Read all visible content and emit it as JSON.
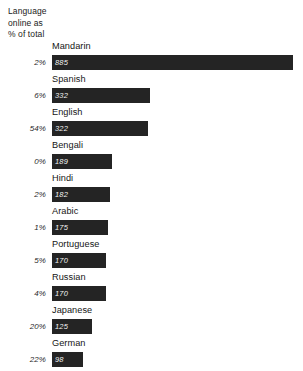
{
  "axis_caption": {
    "line1": "Language",
    "line2": "online as",
    "line3": "% of total"
  },
  "chart_data": {
    "type": "bar",
    "orientation": "horizontal",
    "title": "",
    "subtitle": "",
    "xlabel": "",
    "ylabel": "",
    "categories": [
      "Mandarin",
      "Spanish",
      "English",
      "Bengali",
      "Hindi",
      "Arabic",
      "Portuguese",
      "Russian",
      "Japanese",
      "German"
    ],
    "values": [
      885,
      332,
      322,
      189,
      182,
      175,
      170,
      170,
      125,
      98
    ],
    "value_labels": [
      "885",
      "332",
      "322",
      "189",
      "182",
      "175",
      "170",
      "170",
      "125",
      "98"
    ],
    "secondary_series": {
      "name": "Language online as % of total",
      "labels": [
        "2%",
        "6%",
        "54%",
        "0%",
        "2%",
        "1%",
        "5%",
        "4%",
        "20%",
        "22%"
      ],
      "values": [
        2,
        6,
        54,
        0,
        2,
        1,
        5,
        4,
        20,
        22
      ]
    },
    "xlim": [
      0,
      885
    ],
    "grid": false,
    "legend": "none",
    "bar_color": "#242424",
    "value_text_color": "#f2f2f2",
    "background": "#ffffff"
  },
  "rows": [
    {
      "language": "Mandarin",
      "value": "885",
      "bar_px": 241,
      "pct": "2%"
    },
    {
      "language": "Spanish",
      "value": "332",
      "bar_px": 98,
      "pct": "6%"
    },
    {
      "language": "English",
      "value": "322",
      "bar_px": 96,
      "pct": "54%"
    },
    {
      "language": "Bengali",
      "value": "189",
      "bar_px": 60,
      "pct": "0%"
    },
    {
      "language": "Hindi",
      "value": "182",
      "bar_px": 58,
      "pct": "2%"
    },
    {
      "language": "Arabic",
      "value": "175",
      "bar_px": 56,
      "pct": "1%"
    },
    {
      "language": "Portuguese",
      "value": "170",
      "bar_px": 54,
      "pct": "5%"
    },
    {
      "language": "Russian",
      "value": "170",
      "bar_px": 54,
      "pct": "4%"
    },
    {
      "language": "Japanese",
      "value": "125",
      "bar_px": 40,
      "pct": "20%"
    },
    {
      "language": "German",
      "value": "98",
      "bar_px": 31,
      "pct": "22%"
    }
  ]
}
